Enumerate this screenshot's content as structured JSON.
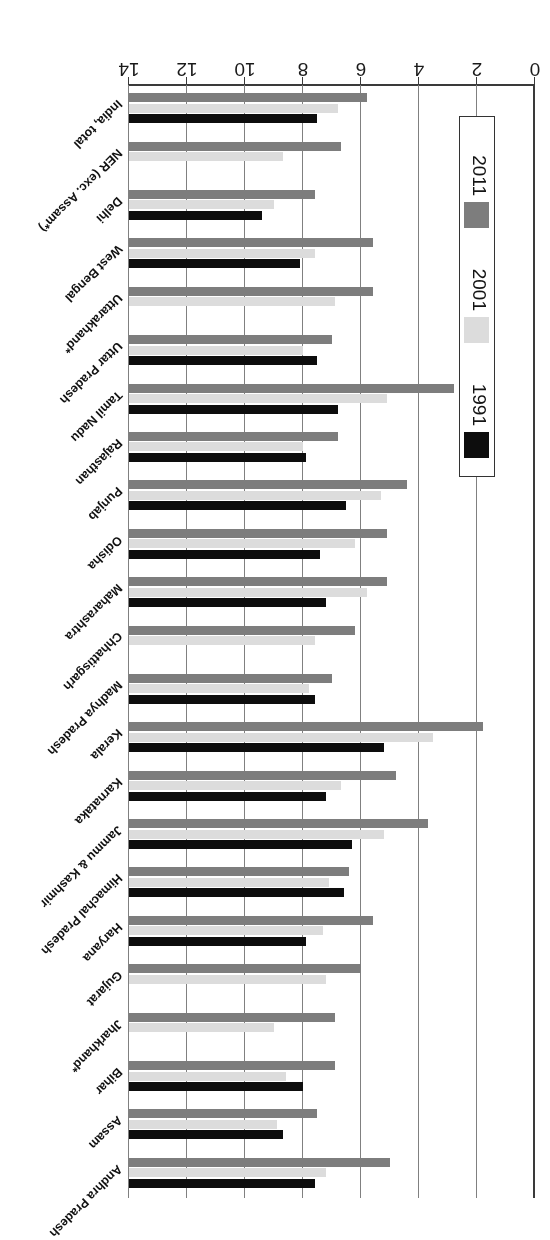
{
  "chart_data": {
    "type": "bar",
    "orientation": "horizontal",
    "title": "",
    "subtitle": "",
    "xlabel": "",
    "ylabel": "",
    "xlim": [
      0,
      14
    ],
    "grid": true,
    "grid_axis": "x",
    "legend_position": "inside-left",
    "tick_labels": [
      "0",
      "2",
      "4",
      "6",
      "8",
      "10",
      "12",
      "14"
    ],
    "tick_values": [
      0,
      2,
      4,
      6,
      8,
      10,
      12,
      14
    ],
    "categories": [
      "Andhra Pradesh",
      "Assam",
      "Bihar",
      "Jharkhand*",
      "Gujarat",
      "Haryana",
      "Himachal Pradesh",
      "Jammu & Kashmir",
      "Karnataka",
      "Kerala",
      "Madhya Pradesh",
      "Chhattisgarh",
      "Maharashtra",
      "Odisha",
      "Punjab",
      "Rajasthan",
      "Tamil Nadu",
      "Uttar Pradesh",
      "Uttarakhand*",
      "West Bengal",
      "Delhi",
      "NER (exc. Assam*)",
      "India, total"
    ],
    "series": [
      {
        "name": "1991",
        "color": "#0d0d0d",
        "values": [
          6.4,
          5.3,
          6.0,
          null,
          null,
          6.1,
          7.4,
          7.7,
          6.8,
          8.8,
          6.4,
          null,
          6.8,
          6.6,
          7.5,
          6.1,
          7.2,
          6.5,
          null,
          5.9,
          4.6,
          null,
          6.5
        ]
      },
      {
        "name": "2001",
        "color": "#dcdcdc",
        "values": [
          6.8,
          5.1,
          5.4,
          5.0,
          6.8,
          6.7,
          6.9,
          8.8,
          7.3,
          10.5,
          6.2,
          6.4,
          8.2,
          7.8,
          8.7,
          6.0,
          8.9,
          6.0,
          7.1,
          6.4,
          5.0,
          5.3,
          7.2
        ]
      },
      {
        "name": "2011",
        "color": "#7d7d7d",
        "values": [
          9.0,
          6.5,
          7.1,
          7.1,
          8.0,
          8.4,
          7.6,
          10.3,
          9.2,
          12.2,
          7.0,
          7.8,
          8.9,
          8.9,
          9.6,
          7.2,
          11.2,
          7.0,
          8.4,
          8.4,
          6.4,
          7.3,
          8.2
        ]
      }
    ],
    "legend": [
      {
        "label": "1991",
        "color": "#0d0d0d"
      },
      {
        "label": "2001",
        "color": "#dcdcdc"
      },
      {
        "label": "2011",
        "color": "#7d7d7d"
      }
    ]
  }
}
